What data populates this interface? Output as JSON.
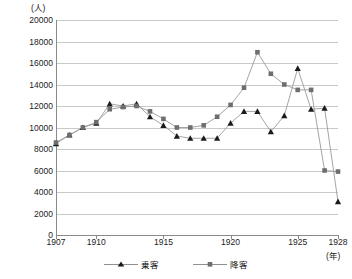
{
  "axes": {
    "y_unit_label": "(人)",
    "x_unit_label": "(年)",
    "y_ticks": [
      "0",
      "2000",
      "4000",
      "6000",
      "8000",
      "10000",
      "12000",
      "14000",
      "16000",
      "18000",
      "20000"
    ],
    "x_ticks": [
      "1907",
      "1910",
      "1915",
      "1920",
      "1925",
      "1928"
    ]
  },
  "legend": {
    "items": [
      {
        "label": "乗客",
        "marker": "triangle",
        "color": "#1a1a1a"
      },
      {
        "label": "降客",
        "marker": "square",
        "color": "#6e6e6e"
      }
    ]
  },
  "chart_data": {
    "type": "line",
    "title": "",
    "xlabel": "(年)",
    "ylabel": "(人)",
    "xlim": [
      1907,
      1928
    ],
    "ylim": [
      0,
      20000
    ],
    "ytick_step": 2000,
    "grid": true,
    "legend_position": "bottom",
    "x": [
      1907,
      1908,
      1909,
      1910,
      1911,
      1912,
      1913,
      1914,
      1915,
      1916,
      1917,
      1918,
      1919,
      1920,
      1921,
      1922,
      1923,
      1924,
      1925,
      1926,
      1927,
      1928
    ],
    "series": [
      {
        "name": "乗客",
        "marker": "triangle",
        "color": "#1a1a1a",
        "values": [
          8500,
          9300,
          10000,
          10400,
          12200,
          12000,
          12200,
          11000,
          10200,
          9200,
          9000,
          9000,
          9000,
          10400,
          11500,
          11500,
          9600,
          11100,
          15500,
          11700,
          11800,
          3100
        ]
      },
      {
        "name": "降客",
        "marker": "square",
        "color": "#6e6e6e",
        "values": [
          8600,
          9300,
          10000,
          10500,
          11700,
          11900,
          12000,
          11500,
          10800,
          10000,
          10000,
          10200,
          11000,
          12100,
          13700,
          17000,
          15000,
          14000,
          13500,
          13500,
          6000,
          5900
        ]
      }
    ]
  }
}
